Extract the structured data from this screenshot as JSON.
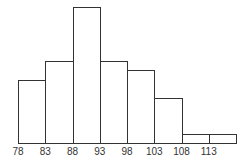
{
  "chart_data": {
    "type": "bar",
    "subtype": "histogram",
    "title": "",
    "xlabel": "",
    "ylabel": "",
    "bin_edges": [
      78,
      83,
      88,
      93,
      98,
      103,
      108,
      113,
      118
    ],
    "tick_labels": [
      "78",
      "83",
      "88",
      "93",
      "98",
      "103",
      "108",
      "113"
    ],
    "values": [
      7,
      9,
      15,
      9,
      8,
      5,
      1,
      1
    ],
    "ylim": [
      0,
      15
    ],
    "grid": false,
    "legend": null
  }
}
